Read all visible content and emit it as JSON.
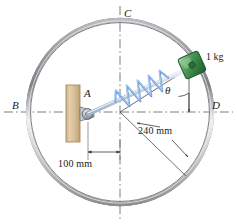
{
  "figure": {
    "background_color": "#ffffff"
  },
  "ring": {
    "name": "circular guide ring",
    "center_x": 120,
    "center_y": 112,
    "radius_px": 92,
    "radius_label": "240 mm",
    "outer_color": "#8d8f92",
    "inner_color": "#d8dade"
  },
  "points": {
    "a": "A",
    "b": "B",
    "c": "C",
    "d": "D"
  },
  "angle": {
    "symbol": "θ"
  },
  "collar": {
    "mass_label": "1 kg",
    "color": "#3f8f4f",
    "highlight_color": "#9fd4a6",
    "edge_color": "#1f5c2c"
  },
  "spring": {
    "color": "#6f9fd8",
    "rod_color": "#c6d4e4"
  },
  "support": {
    "name": "wall bracket",
    "color": "#d9bf9a",
    "edge_color": "#a98b5e",
    "pin_color": "#9a9a9a"
  },
  "dimensions": [
    {
      "label": "100 mm",
      "from": "A",
      "to": "vertical centerline"
    },
    {
      "label": "240 mm",
      "from": "center",
      "to": "ring"
    }
  ],
  "centerlines": {
    "horizontal": "B-D",
    "vertical": "C-bottom",
    "style": "dash-dot",
    "color": "#6e6e6e"
  }
}
